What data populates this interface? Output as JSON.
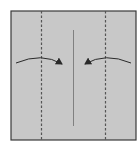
{
  "diagram": {
    "type": "origami-fold-instruction",
    "paper": {
      "fill": "#c8c8c8",
      "stroke": "#3a3a3a"
    },
    "creases": [
      {
        "kind": "valley-fold-dashed",
        "position": "left-quarter"
      },
      {
        "kind": "center-crease",
        "position": "center"
      },
      {
        "kind": "valley-fold-dashed",
        "position": "right-quarter"
      }
    ],
    "arrows": [
      {
        "direction": "left-to-center",
        "label": ""
      },
      {
        "direction": "right-to-center",
        "label": ""
      }
    ],
    "colors": {
      "line": "#3a3a3a",
      "dash": "#555555",
      "crease": "#777777"
    },
    "step_number": ""
  }
}
